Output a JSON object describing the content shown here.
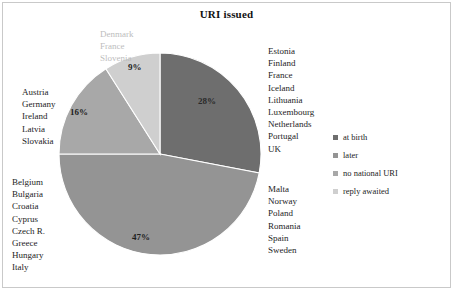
{
  "chart": {
    "title": "URI issued"
  },
  "chart_data": {
    "type": "pie",
    "title": "URI issued",
    "xlabel": "",
    "ylabel": "",
    "categories": [
      "at birth",
      "later",
      "no national URI",
      "reply awaited"
    ],
    "values": [
      28,
      47,
      16,
      9
    ],
    "value_labels": [
      "28%",
      "47%",
      "16%",
      "9%"
    ],
    "colors": [
      "#6e6e6e",
      "#949494",
      "#a8a8a8",
      "#cfcfcf"
    ],
    "legend_position": "right",
    "grid": false,
    "start_angle_deg": 0,
    "direction": "clockwise",
    "annotations": [
      {
        "category": "at birth",
        "position": "right-top",
        "countries": [
          "Estonia",
          "Finland",
          "France",
          "Iceland",
          "Lithuania",
          "Luxembourg",
          "Netherlands",
          "Portugal",
          "UK"
        ]
      },
      {
        "category": "later",
        "position": "right-bottom",
        "countries": [
          "Malta",
          "Norway",
          "Poland",
          "Romania",
          "Spain",
          "Sweden"
        ]
      },
      {
        "category": "later",
        "position": "left-bottom",
        "countries": [
          "Belgium",
          "Bulgaria",
          "Croatia",
          "Cyprus",
          "Czech R.",
          "Greece",
          "Hungary",
          "Italy"
        ]
      },
      {
        "category": "no national URI",
        "position": "left-middle",
        "countries": [
          "Austria",
          "Germany",
          "Ireland",
          "Latvia",
          "Slovakia"
        ]
      },
      {
        "category": "reply awaited",
        "position": "top-left",
        "countries": [
          "Denmark",
          "France",
          "Slovenia"
        ]
      }
    ]
  },
  "legend": {
    "items": [
      {
        "label": "at birth",
        "color": "#6e6e6e"
      },
      {
        "label": "later",
        "color": "#949494"
      },
      {
        "label": "no national URI",
        "color": "#a8a8a8"
      },
      {
        "label": "reply awaited",
        "color": "#cfcfcf"
      }
    ]
  }
}
